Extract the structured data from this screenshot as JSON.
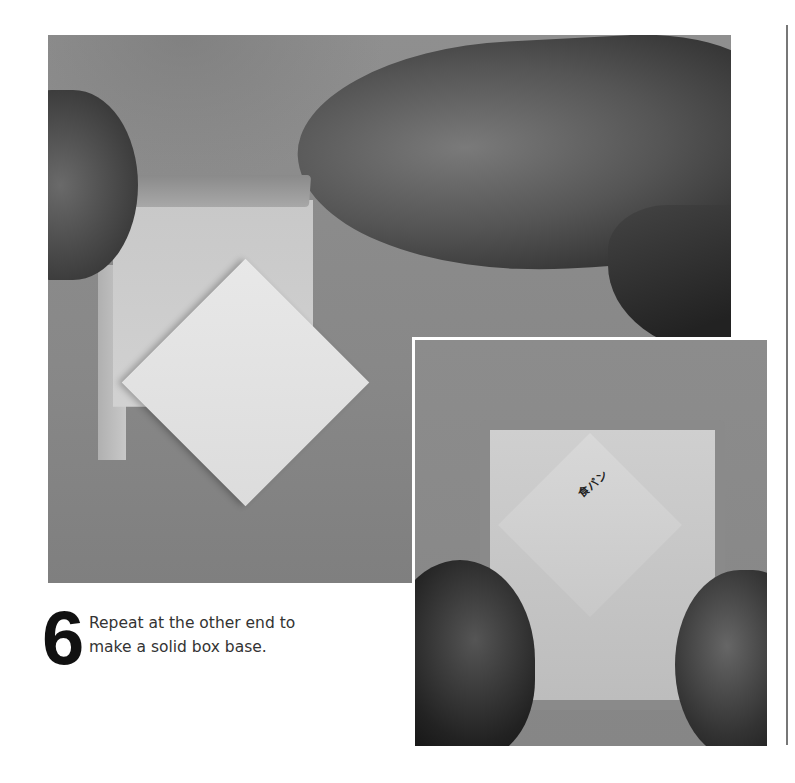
{
  "step": {
    "number": "6",
    "text_line1": "Repeat at the other end to",
    "text_line2": "make a solid box base."
  },
  "images": {
    "main_photo": "hands holding partially folded paper box, pulling up side wall",
    "inset_photo": "completed square paper box base held by hands",
    "inset_label": "食パン"
  }
}
